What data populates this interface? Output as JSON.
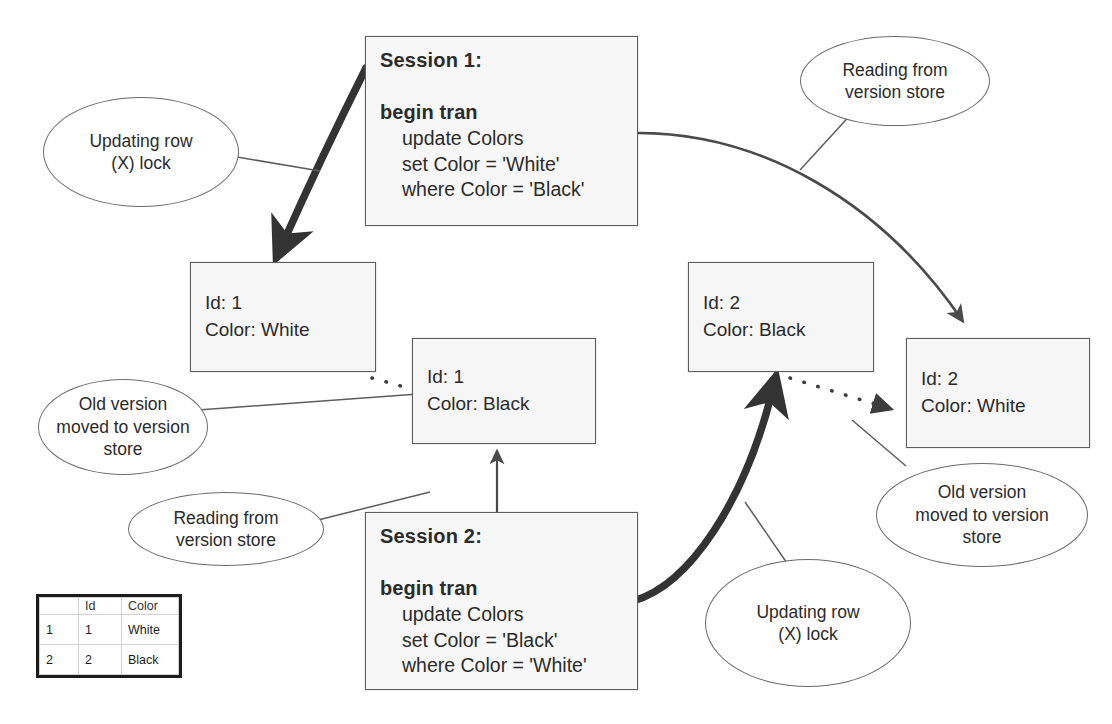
{
  "diagram": {
    "colors": {
      "box_border": "#5d5d5d",
      "box_fill": "#f6f6f6",
      "callout_border": "#6b6b6b",
      "thick_arrow": "#333333",
      "thin_arrow": "#555555",
      "table_border": "#1c1c1c"
    }
  },
  "sessions": [
    {
      "id": "session-1",
      "title": "Session 1:",
      "keyword": "begin tran",
      "lines": [
        "update Colors",
        "set Color = 'White'",
        "where Color = 'Black'"
      ]
    },
    {
      "id": "session-2",
      "title": "Session 2:",
      "keyword": "begin tran",
      "lines": [
        "update Colors",
        "set Color = 'Black'",
        "where Color = 'White'"
      ]
    }
  ],
  "row_boxes": [
    {
      "id": "row-1-white",
      "line1": "Id: 1",
      "line2": "Color: White"
    },
    {
      "id": "row-1-black",
      "line1": "Id: 1",
      "line2": "Color: Black"
    },
    {
      "id": "row-2-black",
      "line1": "Id: 2",
      "line2": "Color: Black"
    },
    {
      "id": "row-2-white",
      "line1": "Id: 2",
      "line2": "Color: White"
    }
  ],
  "callouts": [
    {
      "id": "updating-row-x-lock-left",
      "lines": [
        "Updating row",
        "(X) lock"
      ]
    },
    {
      "id": "reading-from-version-store-top-right",
      "lines": [
        "Reading from",
        "version store"
      ]
    },
    {
      "id": "old-version-moved-left",
      "lines": [
        "Old version",
        "moved to version",
        "store"
      ]
    },
    {
      "id": "reading-from-version-store-bottom-left",
      "lines": [
        "Reading from",
        "version store"
      ]
    },
    {
      "id": "old-version-moved-right",
      "lines": [
        "Old version",
        "moved to version",
        "store"
      ]
    },
    {
      "id": "updating-row-x-lock-bottom",
      "lines": [
        "Updating row",
        "(X) lock"
      ]
    }
  ],
  "result_grid": {
    "headers": [
      "",
      "Id",
      "Color"
    ],
    "rows": [
      {
        "num": "1",
        "id": "1",
        "color": "White"
      },
      {
        "num": "2",
        "id": "2",
        "color": "Black"
      }
    ]
  }
}
